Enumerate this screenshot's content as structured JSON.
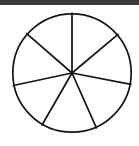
{
  "figure": {
    "top_bar_label": "top-border-bar",
    "top_bar_color": "#3a3a3a",
    "background_color": "#ffffff",
    "stroke_color": "#141414",
    "fill_color": "#ffffff",
    "stroke_width": 1.7
  },
  "chart_data": {
    "type": "pie",
    "title": "",
    "subtitle": "",
    "xlabel": "",
    "ylabel": "",
    "grid": false,
    "legend": false,
    "legend_position": "none",
    "center_x": 72,
    "center_y": 73,
    "radius": 60,
    "slice_count": 7,
    "categories": [
      "Slice 1",
      "Slice 2",
      "Slice 3",
      "Slice 4",
      "Slice 5",
      "Slice 6",
      "Slice 7"
    ],
    "values": [
      49,
      53,
      48,
      54,
      55,
      51,
      50
    ],
    "units": "degrees",
    "spoke_angles_deg": [
      90,
      139,
      192,
      240,
      294,
      349,
      40
    ],
    "spoke_endpoints": [
      {
        "name": "spoke-up",
        "angle_deg": 90,
        "x": 72,
        "y": 13
      },
      {
        "name": "spoke-upper-left",
        "angle_deg": 139,
        "x": 26.7,
        "y": 33.6
      },
      {
        "name": "spoke-left",
        "angle_deg": 192,
        "x": 13.3,
        "y": 85.5
      },
      {
        "name": "spoke-lower-left",
        "angle_deg": 240,
        "x": 42.0,
        "y": 125.0
      },
      {
        "name": "spoke-lower-right",
        "angle_deg": 294,
        "x": 96.4,
        "y": 127.8
      },
      {
        "name": "spoke-right",
        "angle_deg": 349,
        "x": 130.9,
        "y": 84.4
      },
      {
        "name": "spoke-upper-right",
        "angle_deg": 40,
        "x": 118.0,
        "y": 34.4
      }
    ]
  }
}
